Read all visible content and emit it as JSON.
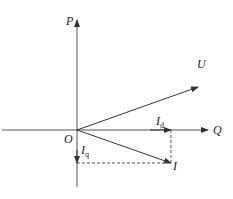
{
  "diagram": {
    "type": "phasor-diagram",
    "origin": {
      "label": "O",
      "x": 77,
      "y": 130
    },
    "axes": {
      "vertical": {
        "label": "P",
        "top_y": 18,
        "bottom_y": 187
      },
      "horizontal": {
        "label": "Q",
        "left_x": 2,
        "right_x": 208
      }
    },
    "vectors": [
      {
        "name": "U",
        "label": "U",
        "x2": 198,
        "y2": 87
      },
      {
        "name": "I",
        "label": "I",
        "x2": 171,
        "y2": 163
      },
      {
        "name": "Id",
        "label": "I",
        "subscript": "d",
        "x2": 171,
        "y2": 130
      },
      {
        "name": "Iq",
        "label": "I",
        "subscript": "q",
        "x2": 77,
        "y2": 163
      }
    ],
    "projections": [
      {
        "from": "I",
        "to": "Id",
        "style": "dashed"
      },
      {
        "from": "I",
        "to": "Iq",
        "style": "dashed"
      }
    ],
    "colors": {
      "line": "#333333",
      "background": "#ffffff"
    }
  }
}
